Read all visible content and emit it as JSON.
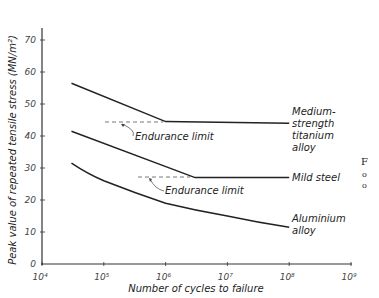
{
  "chart_data": {
    "type": "line",
    "title": "",
    "xlabel": "Number of cycles to failure",
    "ylabel": "Peak value of repeated tensile stress (MN/m²)",
    "xscale": "log",
    "xlim": [
      10000,
      1000000000
    ],
    "ylim": [
      0,
      70
    ],
    "x_ticks": [
      "10⁴",
      "10⁵",
      "10⁶",
      "10⁷",
      "10⁸",
      "10⁹"
    ],
    "y_ticks": [
      "0",
      "10",
      "20",
      "30",
      "40",
      "50",
      "60",
      "70"
    ],
    "grid": false,
    "series": [
      {
        "name": "Medium-strength titanium alloy",
        "label_lines": [
          "Medium-",
          "strength",
          "titanium",
          "alloy"
        ],
        "x": [
          30000,
          1000000,
          100000000
        ],
        "y": [
          56.5,
          44.5,
          44
        ]
      },
      {
        "name": "Mild steel",
        "label_lines": [
          "Mild  steel"
        ],
        "x": [
          30000,
          3000000,
          100000000
        ],
        "y": [
          41.5,
          27,
          27
        ]
      },
      {
        "name": "Aluminium alloy",
        "label_lines": [
          "Aluminium",
          "alloy"
        ],
        "x": [
          30000,
          100000,
          1000000,
          10000000,
          100000000
        ],
        "y": [
          31.5,
          26,
          19,
          15,
          11.5
        ]
      }
    ],
    "annotations": [
      {
        "text": "Endurance limit",
        "target_series": "Medium-strength titanium alloy",
        "y": 44.5
      },
      {
        "text": "Endurance limit",
        "target_series": "Mild steel",
        "y": 27
      }
    ]
  },
  "side_text": [
    "F",
    "o",
    "o"
  ]
}
